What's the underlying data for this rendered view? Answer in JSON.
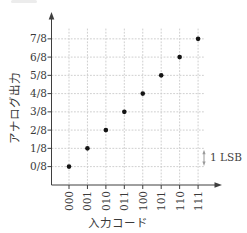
{
  "chart_data": {
    "type": "scatter",
    "title": "",
    "xlabel": "入力コード",
    "ylabel": "アナログ出力",
    "categories": [
      "000",
      "001",
      "010",
      "011",
      "100",
      "101",
      "110",
      "111"
    ],
    "y_tick_labels": [
      "0/8",
      "1/8",
      "2/8",
      "3/8",
      "4/8",
      "5/8",
      "6/8",
      "7/8"
    ],
    "values": [
      0,
      1,
      2,
      3,
      4,
      5,
      6,
      7
    ],
    "points": [
      {
        "input_code": "000",
        "analog_output": "0/8"
      },
      {
        "input_code": "001",
        "analog_output": "1/8"
      },
      {
        "input_code": "010",
        "analog_output": "2/8"
      },
      {
        "input_code": "011",
        "analog_output": "3/8"
      },
      {
        "input_code": "100",
        "analog_output": "4/8"
      },
      {
        "input_code": "101",
        "analog_output": "5/8"
      },
      {
        "input_code": "110",
        "analog_output": "6/8"
      },
      {
        "input_code": "111",
        "analog_output": "7/8"
      },
      {
        "input_code": "111",
        "analog_output": "7/8"
      }
    ],
    "annotation": {
      "text": "1 LSB"
    },
    "grid": true,
    "grid_style": "dotted",
    "marker": "filled-circle",
    "x_tick_label_orientation": "vertical",
    "legend": "none"
  },
  "colors": {
    "axis": "#3f3f3f",
    "grid": "#c9c9c9",
    "point": "#141414",
    "text": "#3a3a3a",
    "annotation_arrow": "#9a9a9a"
  }
}
